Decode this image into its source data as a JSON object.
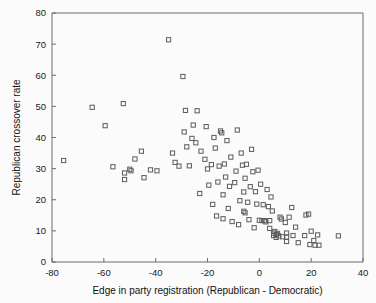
{
  "chart_data": {
    "type": "scatter",
    "title": "",
    "xlabel": "Edge in party registration (Republican - Democratic)",
    "ylabel": "Republican crossover rate",
    "xlim": [
      -80,
      40
    ],
    "ylim": [
      0,
      80
    ],
    "xticks": [
      -80,
      -60,
      -40,
      -20,
      0,
      20,
      40
    ],
    "xtick_labels": [
      "-80",
      "-60",
      "-40",
      "-20",
      "0",
      "20",
      "40"
    ],
    "yticks": [
      0,
      10,
      20,
      30,
      40,
      50,
      60,
      70,
      80
    ],
    "ytick_labels": [
      "0",
      "10",
      "20",
      "30",
      "40",
      "50",
      "60",
      "70",
      "80"
    ],
    "grid": false,
    "legend": null,
    "marker": "open-square",
    "marker_color": "#5b5b5b",
    "series": [
      {
        "name": "counties",
        "points": [
          [
            -75.5,
            32.6
          ],
          [
            -64.5,
            49.7
          ],
          [
            -59.5,
            43.8
          ],
          [
            -56.5,
            30.6
          ],
          [
            -52.5,
            50.9
          ],
          [
            -52.0,
            28.6
          ],
          [
            -52.0,
            26.5
          ],
          [
            -50.0,
            29.8
          ],
          [
            -49.5,
            29.3
          ],
          [
            -48.0,
            33.1
          ],
          [
            -45.5,
            35.6
          ],
          [
            -44.5,
            27.1
          ],
          [
            -42.0,
            29.6
          ],
          [
            -39.5,
            29.3
          ],
          [
            -35.0,
            71.4
          ],
          [
            -33.5,
            35.0
          ],
          [
            -32.5,
            32.0
          ],
          [
            -31.0,
            30.8
          ],
          [
            -29.5,
            59.6
          ],
          [
            -29.0,
            41.8
          ],
          [
            -28.5,
            48.7
          ],
          [
            -28.0,
            37.0
          ],
          [
            -27.0,
            30.9
          ],
          [
            -26.0,
            39.7
          ],
          [
            -25.5,
            44.0
          ],
          [
            -24.5,
            38.3
          ],
          [
            -24.0,
            48.6
          ],
          [
            -23.0,
            22.0
          ],
          [
            -22.5,
            35.6
          ],
          [
            -21.0,
            33.0
          ],
          [
            -20.5,
            43.5
          ],
          [
            -20.0,
            29.9
          ],
          [
            -19.5,
            24.7
          ],
          [
            -18.5,
            31.3
          ],
          [
            -18.0,
            18.5
          ],
          [
            -17.5,
            40.0
          ],
          [
            -17.0,
            36.6
          ],
          [
            -16.5,
            14.8
          ],
          [
            -16.0,
            25.7
          ],
          [
            -15.5,
            30.8
          ],
          [
            -15.0,
            42.1
          ],
          [
            -14.5,
            41.5
          ],
          [
            -14.0,
            21.6
          ],
          [
            -14.0,
            13.9
          ],
          [
            -13.5,
            31.5
          ],
          [
            -13.0,
            27.3
          ],
          [
            -12.5,
            39.0
          ],
          [
            -12.0,
            17.2
          ],
          [
            -11.5,
            24.3
          ],
          [
            -11.0,
            33.7
          ],
          [
            -10.5,
            13.0
          ],
          [
            -9.5,
            25.5
          ],
          [
            -9.0,
            29.2
          ],
          [
            -8.5,
            42.4
          ],
          [
            -8.0,
            12.0
          ],
          [
            -7.5,
            19.7
          ],
          [
            -7.0,
            35.0
          ],
          [
            -6.5,
            31.1
          ],
          [
            -6.0,
            22.5
          ],
          [
            -6.0,
            16.3
          ],
          [
            -5.5,
            26.9
          ],
          [
            -5.5,
            15.8
          ],
          [
            -5.0,
            31.4
          ],
          [
            -4.5,
            19.2
          ],
          [
            -4.0,
            13.6
          ],
          [
            -3.5,
            24.2
          ],
          [
            -3.0,
            36.2
          ],
          [
            -2.5,
            29.0
          ],
          [
            -2.0,
            11.0
          ],
          [
            -1.5,
            22.6
          ],
          [
            -1.0,
            18.6
          ],
          [
            -0.5,
            29.5
          ],
          [
            0.0,
            13.4
          ],
          [
            0.5,
            25.0
          ],
          [
            1.0,
            13.3
          ],
          [
            1.5,
            18.4
          ],
          [
            2.0,
            13.3
          ],
          [
            2.5,
            12.9
          ],
          [
            3.0,
            23.3
          ],
          [
            3.5,
            17.8
          ],
          [
            4.0,
            13.3
          ],
          [
            4.0,
            10.8
          ],
          [
            4.5,
            20.9
          ],
          [
            5.0,
            16.4
          ],
          [
            5.5,
            9.3
          ],
          [
            5.5,
            8.5
          ],
          [
            6.0,
            9.8
          ],
          [
            6.5,
            8.8
          ],
          [
            6.5,
            7.9
          ],
          [
            7.0,
            9.2
          ],
          [
            7.5,
            8.4
          ],
          [
            8.0,
            14.4
          ],
          [
            8.5,
            13.8
          ],
          [
            9.0,
            8.1
          ],
          [
            10.0,
            12.7
          ],
          [
            10.5,
            9.3
          ],
          [
            10.5,
            8.0
          ],
          [
            10.5,
            6.6
          ],
          [
            11.5,
            14.4
          ],
          [
            12.5,
            17.5
          ],
          [
            13.0,
            8.5
          ],
          [
            14.0,
            11.2
          ],
          [
            15.0,
            6.2
          ],
          [
            17.5,
            8.5
          ],
          [
            18.0,
            15.1
          ],
          [
            19.0,
            15.4
          ],
          [
            19.5,
            5.6
          ],
          [
            20.0,
            9.9
          ],
          [
            21.0,
            6.9
          ],
          [
            21.5,
            5.4
          ],
          [
            22.5,
            8.7
          ],
          [
            23.0,
            5.4
          ],
          [
            30.5,
            8.4
          ]
        ]
      }
    ]
  },
  "figure": {
    "name": "republican-crossover-scatter"
  }
}
